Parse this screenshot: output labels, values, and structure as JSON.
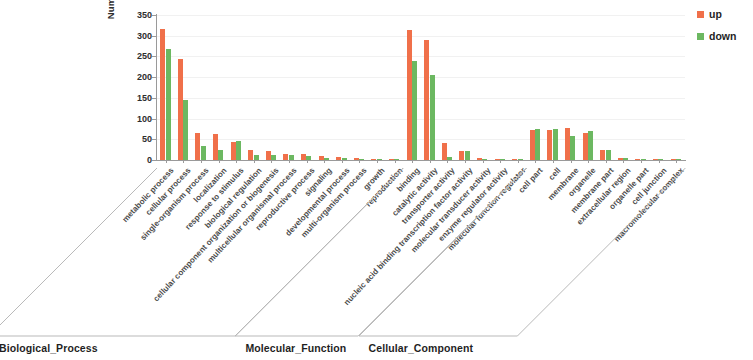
{
  "chart_data": {
    "type": "bar",
    "title": "",
    "xlabel": "",
    "ylabel": "Number of genes",
    "ylim": [
      0,
      350
    ],
    "yticks": [
      0,
      50,
      100,
      150,
      200,
      250,
      300,
      350
    ],
    "grid": true,
    "legend_position": "right",
    "series": [
      {
        "name": "up",
        "color": "#f0704a",
        "values": [
          317,
          243,
          65,
          64,
          43,
          24,
          22,
          15,
          14,
          10,
          8,
          4,
          2,
          1,
          315,
          290,
          40,
          22,
          4,
          2,
          1,
          72,
          72,
          78,
          66,
          25,
          6,
          3,
          2,
          1
        ]
      },
      {
        "name": "down",
        "color": "#6cb861",
        "values": [
          268,
          146,
          34,
          24,
          47,
          11,
          11,
          11,
          9,
          6,
          4,
          2,
          1,
          1,
          240,
          205,
          8,
          22,
          3,
          1,
          1,
          74,
          74,
          57,
          70,
          25,
          4,
          2,
          1,
          1
        ]
      }
    ],
    "categories": [
      "metabolic process",
      "cellular process",
      "single-organism process",
      "localization",
      "response to stimulus",
      "biological regulation",
      "cellular component organization or biogenesis",
      "multicellular organismal process",
      "reproductive process",
      "signaling",
      "developmental process",
      "multi-organism process",
      "growth",
      "reproduction",
      "binding",
      "catalytic activity",
      "transporter activity",
      "nucleic acid binding transcription factor activity",
      "molecular transducer activity",
      "enzyme regulator activity",
      "molecular function regulator",
      "cell part",
      "cell",
      "membrane",
      "organelle",
      "membrane part",
      "extracellular region",
      "organelle part",
      "cell junction",
      "macromolecular complex"
    ],
    "groups": [
      {
        "label": "Biological_Process",
        "start_index": 0,
        "count": 14
      },
      {
        "label": "Molecular_Function",
        "start_index": 14,
        "count": 7
      },
      {
        "label": "Cellular_Component",
        "start_index": 21,
        "count": 9
      }
    ]
  },
  "legend": {
    "items": [
      {
        "label": "up",
        "color": "#f0704a"
      },
      {
        "label": "down",
        "color": "#6cb861"
      }
    ]
  }
}
